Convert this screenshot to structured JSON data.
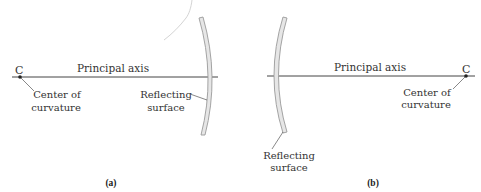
{
  "figure": {
    "colors": {
      "background": "#ffffff",
      "line": "#444444",
      "mirror_fill": "#e6e6e6",
      "mirror_edge": "#9a9a9a",
      "faint_arc": "#d4d4d4",
      "text": "#333333"
    },
    "panels": [
      {
        "id": "a",
        "caption": "(a)",
        "principal_axis_label": "Principal axis",
        "center_symbol": "C",
        "center_label_line1": "Center of",
        "center_label_line2": "curvature",
        "surface_label_line1": "Reflecting",
        "surface_label_line2": "surface",
        "mirror_type": "concave (center of curvature on the left)"
      },
      {
        "id": "b",
        "caption": "(b)",
        "principal_axis_label": "Principal axis",
        "center_symbol": "C",
        "center_label_line1": "Center of",
        "center_label_line2": "curvature",
        "surface_label_line1": "Reflecting",
        "surface_label_line2": "surface",
        "mirror_type": "convex (center of curvature on the right)"
      }
    ]
  }
}
